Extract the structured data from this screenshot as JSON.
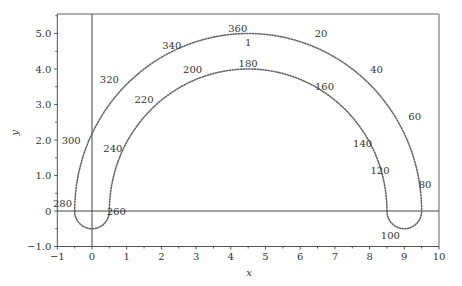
{
  "chart_data": {
    "type": "line",
    "title": "",
    "xlabel": "x",
    "ylabel": "y",
    "xlim": [
      -1,
      10
    ],
    "ylim": [
      -1.0,
      5.5
    ],
    "x_ticks": [
      "−1",
      "0",
      "1",
      "2",
      "3",
      "4",
      "5",
      "6",
      "7",
      "8",
      "9",
      "10"
    ],
    "y_ticks": [
      "−1.0",
      "0",
      "1.0",
      "2.0",
      "3.0",
      "4.0",
      "5.0"
    ],
    "grid": false,
    "legend": null,
    "series": [
      {
        "name": "outer arc",
        "style": "dotted",
        "description": "semicircle centered (4.5, 0), radius 5",
        "points": [
          [
            -0.5,
            0
          ],
          [
            0.0,
            2.2
          ],
          [
            1.0,
            3.8
          ],
          [
            2.0,
            4.6
          ],
          [
            4.5,
            5.0
          ],
          [
            7.0,
            4.6
          ],
          [
            8.0,
            3.8
          ],
          [
            9.0,
            2.1
          ],
          [
            9.5,
            0
          ]
        ]
      },
      {
        "name": "inner arc",
        "style": "dotted",
        "description": "semicircle centered (4.5, 0), radius 4",
        "points": [
          [
            0.5,
            0
          ],
          [
            1.0,
            1.9
          ],
          [
            2.0,
            3.1
          ],
          [
            3.0,
            3.7
          ],
          [
            4.5,
            4.0
          ],
          [
            6.0,
            3.7
          ],
          [
            7.0,
            3.1
          ],
          [
            8.0,
            1.9
          ],
          [
            8.5,
            0
          ]
        ]
      },
      {
        "name": "left loop",
        "style": "dotted",
        "points": [
          [
            -0.5,
            0
          ],
          [
            0,
            -0.5
          ],
          [
            0.5,
            0
          ]
        ]
      },
      {
        "name": "right loop",
        "style": "dotted",
        "points": [
          [
            8.5,
            0
          ],
          [
            9,
            -0.5
          ],
          [
            9.5,
            0
          ]
        ]
      }
    ],
    "annotations": [
      {
        "text": "360",
        "x": 4.2,
        "y": 5.15
      },
      {
        "text": "1",
        "x": 4.5,
        "y": 4.75
      },
      {
        "text": "20",
        "x": 6.6,
        "y": 5.0
      },
      {
        "text": "40",
        "x": 8.2,
        "y": 4.0
      },
      {
        "text": "60",
        "x": 9.3,
        "y": 2.65
      },
      {
        "text": "80",
        "x": 9.6,
        "y": 0.75
      },
      {
        "text": "100",
        "x": 8.6,
        "y": -0.7
      },
      {
        "text": "120",
        "x": 8.3,
        "y": 1.15
      },
      {
        "text": "140",
        "x": 7.8,
        "y": 1.9
      },
      {
        "text": "160",
        "x": 6.7,
        "y": 3.5
      },
      {
        "text": "180",
        "x": 4.5,
        "y": 4.15
      },
      {
        "text": "200",
        "x": 2.9,
        "y": 4.0
      },
      {
        "text": "220",
        "x": 1.5,
        "y": 3.15
      },
      {
        "text": "240",
        "x": 0.6,
        "y": 1.75
      },
      {
        "text": "260",
        "x": 0.7,
        "y": 0
      },
      {
        "text": "280",
        "x": -0.85,
        "y": 0.2
      },
      {
        "text": "300",
        "x": -0.6,
        "y": 2.0
      },
      {
        "text": "320",
        "x": 0.5,
        "y": 3.7
      },
      {
        "text": "340",
        "x": 2.3,
        "y": 4.65
      }
    ]
  }
}
